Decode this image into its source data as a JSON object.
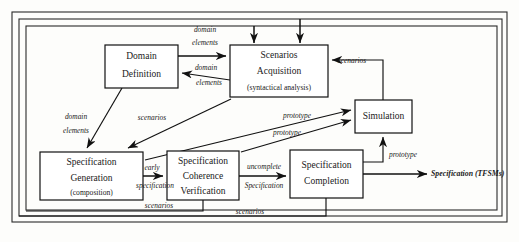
{
  "diagram": {
    "colors": {
      "stroke": "#111111",
      "frame": "#2a2a2a",
      "box_fill": "#ffffff",
      "background": "#fdfdfb"
    },
    "nodes": [
      {
        "id": "domain-definition",
        "lines": [
          "Domain",
          "Definition"
        ],
        "sub": "",
        "x": 105,
        "y": 45,
        "w": 73,
        "h": 43
      },
      {
        "id": "scenarios-acquisition",
        "lines": [
          "Scenarios",
          "Acquisition"
        ],
        "sub": "(syntactical analysis)",
        "x": 230,
        "y": 45,
        "w": 98,
        "h": 52
      },
      {
        "id": "simulation",
        "lines": [
          "Simulation"
        ],
        "sub": "",
        "x": 355,
        "y": 100,
        "w": 57,
        "h": 33
      },
      {
        "id": "specification-generation",
        "lines": [
          "Specification",
          "Generation"
        ],
        "sub": "(composition)",
        "x": 40,
        "y": 152,
        "w": 103,
        "h": 48
      },
      {
        "id": "specification-coherence-verification",
        "lines": [
          "Specification",
          "Coherence",
          "Verification"
        ],
        "sub": "",
        "x": 167,
        "y": 151,
        "w": 72,
        "h": 49
      },
      {
        "id": "specification-completion",
        "lines": [
          "Specification",
          "Completion"
        ],
        "sub": "",
        "x": 290,
        "y": 150,
        "w": 73,
        "h": 48
      }
    ],
    "edge_labels": [
      {
        "id": "domain-elements-out",
        "lines": [
          "domain",
          "elements"
        ],
        "x": 205,
        "y": 30,
        "anchor": "mid"
      },
      {
        "id": "domain-elements-back",
        "lines": [
          "domain",
          "elements"
        ],
        "x": 204,
        "y": 68,
        "anchor": "mid"
      },
      {
        "id": "domain-elements-down",
        "lines": [
          "domain",
          "elements"
        ],
        "x": 76,
        "y": 117,
        "anchor": "mid"
      },
      {
        "id": "scenarios-to-generation",
        "lines": [
          "scenarios"
        ],
        "x": 152,
        "y": 118,
        "anchor": "mid"
      },
      {
        "id": "scenarios-from-simulation",
        "lines": [
          "scenarios"
        ],
        "x": 352,
        "y": 63,
        "anchor": "mid"
      },
      {
        "id": "early-specification",
        "lines": [
          "early",
          "specification"
        ],
        "x": 155,
        "y": 172,
        "anchor": "mid"
      },
      {
        "id": "uncomplete-specification",
        "lines": [
          "uncomplete",
          "Specification"
        ],
        "x": 265,
        "y": 170,
        "anchor": "mid"
      },
      {
        "id": "prototype-upper",
        "lines": [
          "prototype"
        ],
        "x": 297,
        "y": 116,
        "anchor": "mid"
      },
      {
        "id": "prototype-lower",
        "lines": [
          "prototype"
        ],
        "x": 287,
        "y": 133,
        "anchor": "mid"
      },
      {
        "id": "prototype-to-simulation",
        "lines": [
          "prototype"
        ],
        "x": 396,
        "y": 155,
        "anchor": "start"
      },
      {
        "id": "scenarios-feedback-inner",
        "lines": [
          "scenarios"
        ],
        "x": 159,
        "y": 207,
        "anchor": "mid"
      },
      {
        "id": "scenarios-feedback-outer",
        "lines": [
          "scenarios"
        ],
        "x": 250,
        "y": 219,
        "anchor": "mid"
      }
    ],
    "output": {
      "id": "specification-tfsms",
      "label": "Specification (TFSMs)",
      "x": 431,
      "y": 174
    },
    "frames": [
      {
        "id": "frame-outer",
        "x": 12,
        "y": 12,
        "w": 495,
        "h": 210
      },
      {
        "id": "frame-middle",
        "x": 19,
        "y": 19,
        "w": 483,
        "h": 197
      },
      {
        "id": "frame-inner",
        "x": 26,
        "y": 26,
        "w": 471,
        "h": 184
      }
    ]
  }
}
